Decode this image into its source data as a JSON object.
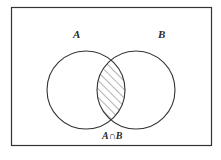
{
  "diagram": {
    "type": "venn",
    "labels": {
      "set_a": "A",
      "set_b": "B",
      "intersection": "A∩B"
    },
    "shaded_region": "intersection",
    "colors": {
      "stroke": "#333333",
      "hatch": "#555555",
      "background": "#ffffff"
    }
  }
}
